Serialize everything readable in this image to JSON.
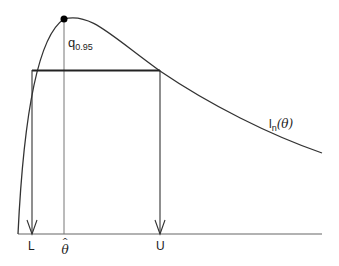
{
  "diagram": {
    "type": "likelihood-interval",
    "curve_label": {
      "main": "l",
      "sub": "n",
      "arg": "(θ)"
    },
    "peak_label": {
      "main": "q",
      "sub": "0.95"
    },
    "axis_labels": {
      "lower": "L",
      "mle": "θ",
      "mle_hat": "^",
      "upper": "U"
    },
    "colors": {
      "curve": "#333333",
      "bar": "#222222",
      "guide": "#777777",
      "axis": "#666666",
      "dot": "#000000"
    }
  }
}
